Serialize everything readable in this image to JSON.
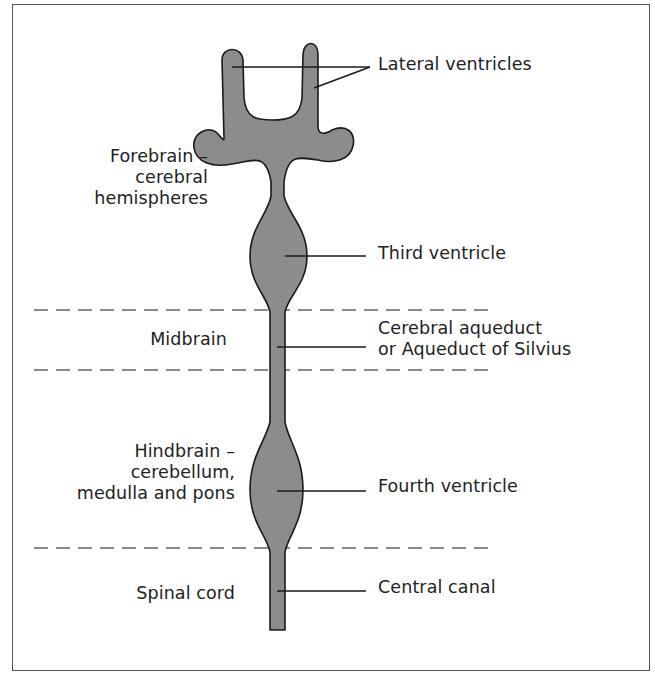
{
  "diagram": {
    "colors": {
      "fill": "#8c8c8c",
      "outline": "#1a1a1a",
      "leader": "#1a1a1a",
      "dash": "#666666",
      "frame": "#555555",
      "text": "#222222"
    },
    "regions": [
      {
        "id": "forebrain",
        "line1": "Forebrain –",
        "line2": "cerebral",
        "line3": "hemispheres"
      },
      {
        "id": "midbrain",
        "line1": "Midbrain"
      },
      {
        "id": "hindbrain",
        "line1": "Hindbrain –",
        "line2": "cerebellum,",
        "line3": "medulla and pons"
      },
      {
        "id": "spinal-cord",
        "line1": "Spinal cord"
      }
    ],
    "structures": [
      {
        "id": "lateral-ventricles",
        "line1": "Lateral ventricles"
      },
      {
        "id": "third-ventricle",
        "line1": "Third ventricle"
      },
      {
        "id": "cerebral-aqueduct",
        "line1": "Cerebral aqueduct",
        "line2": "or Aqueduct of Silvius"
      },
      {
        "id": "fourth-ventricle",
        "line1": "Fourth ventricle"
      },
      {
        "id": "central-canal",
        "line1": "Central canal"
      }
    ],
    "boundaries_y": [
      310,
      370,
      548
    ]
  }
}
